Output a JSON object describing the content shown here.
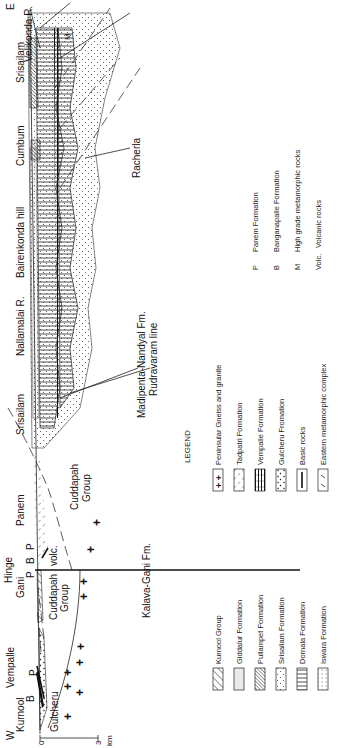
{
  "section": {
    "west_label": "W",
    "east_label": "E",
    "scale": {
      "zero": "0",
      "three": "3",
      "unit": "km"
    },
    "surface_localities": [
      {
        "id": "kurnool",
        "label": "Kurnool"
      },
      {
        "id": "vempalle",
        "label": "Vempalle"
      },
      {
        "id": "gani",
        "label": "Gani"
      },
      {
        "id": "hinge",
        "label": "Hinge"
      },
      {
        "id": "panem",
        "label": "Panem"
      },
      {
        "id": "srisailam-w",
        "label": "Srisailam"
      },
      {
        "id": "nallamalai",
        "label": "Nallamalai R."
      },
      {
        "id": "bairenkonda",
        "label": "Bairenkonda hill"
      },
      {
        "id": "cumbum",
        "label": "Cumbum"
      },
      {
        "id": "srisailam-e",
        "label": "Srisailam"
      },
      {
        "id": "velikonda",
        "label": "Velikonda R."
      }
    ],
    "unit_labels": {
      "gulcheru": "Gulcheru",
      "b1": "B",
      "p1": "P",
      "p2": "P",
      "b2": "B",
      "p3": "P",
      "cuddapah_group_w_1": "Cuddapah",
      "cuddapah_group_w_2": "Group",
      "volc": "volc.",
      "cuddapah_group_e_1": "Cuddapah",
      "cuddapah_group_e_2": "Group",
      "m": "M"
    },
    "callouts": {
      "kalava_gani": "Kalava-Gani Fm.",
      "madipenta": "Madipenta-Nandyal Fm.",
      "rudravaram": "Rudravaram line",
      "racherla": "Racherla"
    }
  },
  "legend": {
    "title": "LEGEND",
    "column_1": [
      {
        "pattern": "diagonal-hatch",
        "label": "Kurnool Group"
      },
      {
        "pattern": "fine-stipple",
        "label": "Giddalur Formation"
      },
      {
        "pattern": "dense-diagonal-hatch",
        "label": "Pullampet Formation"
      },
      {
        "pattern": "sparse-dots",
        "label": "Srisailam Formation"
      },
      {
        "pattern": "vertical-lines",
        "label": "Dornala Formation"
      },
      {
        "pattern": "grid-dots",
        "label": "Iswara Formation"
      }
    ],
    "column_2": [
      {
        "pattern": "crosses",
        "label": "Peninsular Gneiss and granite"
      },
      {
        "pattern": "dashed-diagonal",
        "label": "Tadpatri Formation"
      },
      {
        "pattern": "banded",
        "label": "Vempalle Formation"
      },
      {
        "pattern": "coarse-dots",
        "label": "Gulcheru Fromation"
      },
      {
        "pattern": "single-bar",
        "label": "Basic rocks"
      },
      {
        "pattern": "ticks",
        "label": "Eastern metamorphic complex"
      }
    ],
    "column_3": [
      {
        "abbr": "P",
        "label": "Panem Formation"
      },
      {
        "abbr": "B",
        "label": "Banganapalle Formation"
      },
      {
        "abbr": "M",
        "label": "High grade metamorphic rocks"
      },
      {
        "abbr": "Volc.",
        "label": "Volcanic rocks"
      }
    ]
  }
}
